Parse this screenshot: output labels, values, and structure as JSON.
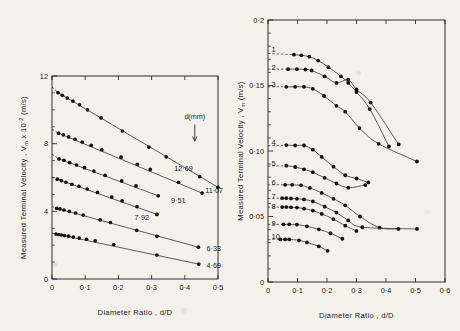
{
  "figure": {
    "background_color": "#f4f1ea",
    "ink_color": "#1b1b1b"
  },
  "chart_data": [
    {
      "id": "left-plot",
      "type": "scatter",
      "title": "",
      "xlabel": "Diameter Ratio , d/D",
      "ylabel": "Measured  Terminal  Velocity ,  Vₘ  x 10⁻² (m/s)",
      "ylabel_parts": {
        "prefix": "Measured  Terminal  Velocity ,  V",
        "sub": "m",
        "suffix": "  x 10",
        "exp": "-2",
        "units": " (m/s)"
      },
      "xlim": [
        0,
        0.5
      ],
      "ylim": [
        0,
        12
      ],
      "xticks": [
        0,
        0.1,
        0.2,
        0.3,
        0.4,
        0.5
      ],
      "xticklabels": [
        "0",
        "0·1",
        "0·2",
        "0·3",
        "0·4",
        "0·5"
      ],
      "yticks": [
        0,
        4,
        8,
        12
      ],
      "yticklabels": [
        "0",
        "4",
        "8",
        "12"
      ],
      "yminor_step": 1,
      "grid": false,
      "legend_position": "inline-right-of-each-series",
      "annotation": {
        "text": "d(mm)",
        "arrow": "down",
        "x": 0.43,
        "y": 9.2
      },
      "series": [
        {
          "name": "12·69",
          "label": "12·69",
          "label_x": 0.355,
          "label_y": 6.55,
          "intercept": 11.35,
          "points": [
            {
              "x": 0.018,
              "y": 11.02
            },
            {
              "x": 0.031,
              "y": 10.86
            },
            {
              "x": 0.046,
              "y": 10.7
            },
            {
              "x": 0.063,
              "y": 10.52
            },
            {
              "x": 0.083,
              "y": 10.3
            },
            {
              "x": 0.107,
              "y": 10.0
            },
            {
              "x": 0.148,
              "y": 9.52
            },
            {
              "x": 0.212,
              "y": 8.75
            },
            {
              "x": 0.292,
              "y": 7.8
            },
            {
              "x": 0.344,
              "y": 7.22
            },
            {
              "x": 0.445,
              "y": 6.05
            },
            {
              "x": 0.5,
              "y": 5.42
            }
          ]
        },
        {
          "name": "11·07",
          "label": "11·07",
          "label_x": 0.448,
          "label_y": 5.22,
          "intercept": 8.85,
          "points": [
            {
              "x": 0.02,
              "y": 8.62
            },
            {
              "x": 0.034,
              "y": 8.52
            },
            {
              "x": 0.05,
              "y": 8.4
            },
            {
              "x": 0.069,
              "y": 8.26
            },
            {
              "x": 0.091,
              "y": 8.1
            },
            {
              "x": 0.118,
              "y": 7.9
            },
            {
              "x": 0.15,
              "y": 7.64
            },
            {
              "x": 0.208,
              "y": 7.2
            },
            {
              "x": 0.257,
              "y": 6.78
            },
            {
              "x": 0.296,
              "y": 6.48
            },
            {
              "x": 0.381,
              "y": 5.72
            },
            {
              "x": 0.452,
              "y": 5.08
            }
          ]
        },
        {
          "name": "9·51",
          "label": "9·51",
          "label_x": 0.345,
          "label_y": 4.62,
          "intercept": 7.38,
          "points": [
            {
              "x": 0.021,
              "y": 7.1
            },
            {
              "x": 0.036,
              "y": 7.02
            },
            {
              "x": 0.053,
              "y": 6.88
            },
            {
              "x": 0.074,
              "y": 6.74
            },
            {
              "x": 0.098,
              "y": 6.58
            },
            {
              "x": 0.126,
              "y": 6.38
            },
            {
              "x": 0.16,
              "y": 6.12
            },
            {
              "x": 0.21,
              "y": 5.8
            },
            {
              "x": 0.253,
              "y": 5.5
            },
            {
              "x": 0.32,
              "y": 4.92
            }
          ]
        },
        {
          "name": "7·92",
          "label": "7·92",
          "label_x": 0.235,
          "label_y": 3.62,
          "intercept": 6.0,
          "points": [
            {
              "x": 0.016,
              "y": 5.9
            },
            {
              "x": 0.028,
              "y": 5.82
            },
            {
              "x": 0.042,
              "y": 5.72
            },
            {
              "x": 0.06,
              "y": 5.6
            },
            {
              "x": 0.081,
              "y": 5.48
            },
            {
              "x": 0.106,
              "y": 5.32
            },
            {
              "x": 0.137,
              "y": 5.12
            },
            {
              "x": 0.18,
              "y": 4.84
            },
            {
              "x": 0.211,
              "y": 4.62
            },
            {
              "x": 0.256,
              "y": 4.28
            },
            {
              "x": 0.316,
              "y": 3.82
            }
          ]
        },
        {
          "name": "6·33",
          "label": "6·33",
          "label_x": 0.452,
          "label_y": 1.78,
          "intercept": 4.28,
          "points": [
            {
              "x": 0.014,
              "y": 4.18
            },
            {
              "x": 0.024,
              "y": 4.14
            },
            {
              "x": 0.036,
              "y": 4.08
            },
            {
              "x": 0.052,
              "y": 4.0
            },
            {
              "x": 0.071,
              "y": 3.9
            },
            {
              "x": 0.094,
              "y": 3.78
            },
            {
              "x": 0.145,
              "y": 3.5
            },
            {
              "x": 0.176,
              "y": 3.34
            },
            {
              "x": 0.255,
              "y": 2.88
            },
            {
              "x": 0.316,
              "y": 2.52
            },
            {
              "x": 0.441,
              "y": 1.88
            }
          ]
        },
        {
          "name": "4·69",
          "label": "4·69",
          "label_x": 0.452,
          "label_y": 0.8,
          "intercept": 2.72,
          "points": [
            {
              "x": 0.012,
              "y": 2.66
            },
            {
              "x": 0.02,
              "y": 2.63
            },
            {
              "x": 0.028,
              "y": 2.6
            },
            {
              "x": 0.038,
              "y": 2.57
            },
            {
              "x": 0.05,
              "y": 2.53
            },
            {
              "x": 0.064,
              "y": 2.48
            },
            {
              "x": 0.082,
              "y": 2.42
            },
            {
              "x": 0.104,
              "y": 2.35
            },
            {
              "x": 0.13,
              "y": 2.26
            },
            {
              "x": 0.186,
              "y": 2.04
            },
            {
              "x": 0.316,
              "y": 1.42
            },
            {
              "x": 0.442,
              "y": 0.88
            }
          ]
        }
      ]
    },
    {
      "id": "right-plot",
      "type": "scatter",
      "title": "",
      "xlabel": "Diameter Ratio , d/D",
      "ylabel": "Measured  Terminal  Velocity ,  Vₘ   (m/s)",
      "ylabel_parts": {
        "prefix": "Measured  Terminal  Velocity ,  V",
        "sub": "m",
        "units": "   (m/s)"
      },
      "xlim": [
        0,
        0.6
      ],
      "ylim": [
        0,
        0.2
      ],
      "xticks": [
        0,
        0.1,
        0.2,
        0.3,
        0.4,
        0.5,
        0.6
      ],
      "xticklabels": [
        "0",
        "0·1",
        "0·2",
        "0·3",
        "0·4",
        "0·5",
        "0·6"
      ],
      "yticks": [
        0,
        0.05,
        0.1,
        0.15,
        0.2
      ],
      "yticklabels": [
        "0",
        "0·05",
        "0·10",
        "0·15",
        "0·2"
      ],
      "yminor_step": 0.01,
      "grid": false,
      "legend_position": "left-leader-lines",
      "series": [
        {
          "name": "1",
          "label": "1",
          "label_y": 0.1775,
          "plateau": 0.1745,
          "points": [
            {
              "x": 0.088,
              "y": 0.1735
            },
            {
              "x": 0.113,
              "y": 0.173
            },
            {
              "x": 0.14,
              "y": 0.172
            },
            {
              "x": 0.17,
              "y": 0.169
            },
            {
              "x": 0.205,
              "y": 0.164
            },
            {
              "x": 0.247,
              "y": 0.157
            },
            {
              "x": 0.272,
              "y": 0.152
            },
            {
              "x": 0.3,
              "y": 0.145
            },
            {
              "x": 0.345,
              "y": 0.132
            },
            {
              "x": 0.41,
              "y": 0.1035
            }
          ]
        },
        {
          "name": "2",
          "label": "2",
          "label_y": 0.164,
          "plateau": 0.1625,
          "points": [
            {
              "x": 0.068,
              "y": 0.1625
            },
            {
              "x": 0.098,
              "y": 0.1625
            },
            {
              "x": 0.127,
              "y": 0.1622
            },
            {
              "x": 0.148,
              "y": 0.1615
            },
            {
              "x": 0.192,
              "y": 0.157
            },
            {
              "x": 0.232,
              "y": 0.152
            },
            {
              "x": 0.272,
              "y": 0.1545
            },
            {
              "x": 0.3,
              "y": 0.147
            },
            {
              "x": 0.348,
              "y": 0.137
            },
            {
              "x": 0.443,
              "y": 0.105
            }
          ]
        },
        {
          "name": "3",
          "label": "3",
          "label_y": 0.1505,
          "plateau": 0.149,
          "points": [
            {
              "x": 0.062,
              "y": 0.149
            },
            {
              "x": 0.092,
              "y": 0.149
            },
            {
              "x": 0.122,
              "y": 0.149
            },
            {
              "x": 0.152,
              "y": 0.1475
            },
            {
              "x": 0.19,
              "y": 0.142
            },
            {
              "x": 0.232,
              "y": 0.1345
            },
            {
              "x": 0.262,
              "y": 0.13
            },
            {
              "x": 0.31,
              "y": 0.1175
            },
            {
              "x": 0.375,
              "y": 0.1055
            },
            {
              "x": 0.505,
              "y": 0.092
            }
          ]
        },
        {
          "name": "4",
          "label": "4",
          "label_y": 0.1065,
          "plateau": 0.104,
          "points": [
            {
              "x": 0.062,
              "y": 0.1045
            },
            {
              "x": 0.092,
              "y": 0.1042
            },
            {
              "x": 0.122,
              "y": 0.1042
            },
            {
              "x": 0.152,
              "y": 0.101
            },
            {
              "x": 0.182,
              "y": 0.0955
            },
            {
              "x": 0.222,
              "y": 0.088
            },
            {
              "x": 0.262,
              "y": 0.0815
            },
            {
              "x": 0.3,
              "y": 0.079
            },
            {
              "x": 0.34,
              "y": 0.076
            }
          ]
        },
        {
          "name": "5",
          "label": "5",
          "label_y": 0.0905,
          "plateau": 0.0885,
          "points": [
            {
              "x": 0.062,
              "y": 0.0888
            },
            {
              "x": 0.092,
              "y": 0.0878
            },
            {
              "x": 0.122,
              "y": 0.086
            },
            {
              "x": 0.152,
              "y": 0.0838
            },
            {
              "x": 0.192,
              "y": 0.0795
            },
            {
              "x": 0.232,
              "y": 0.0752
            },
            {
              "x": 0.272,
              "y": 0.072
            },
            {
              "x": 0.33,
              "y": 0.074
            }
          ]
        },
        {
          "name": "6",
          "label": "6",
          "label_y": 0.076,
          "plateau": 0.0742,
          "points": [
            {
              "x": 0.058,
              "y": 0.0742
            },
            {
              "x": 0.082,
              "y": 0.0742
            },
            {
              "x": 0.112,
              "y": 0.0738
            },
            {
              "x": 0.142,
              "y": 0.0718
            },
            {
              "x": 0.182,
              "y": 0.068
            },
            {
              "x": 0.222,
              "y": 0.0635
            },
            {
              "x": 0.262,
              "y": 0.0585
            },
            {
              "x": 0.312,
              "y": 0.05
            },
            {
              "x": 0.378,
              "y": 0.0415
            },
            {
              "x": 0.442,
              "y": 0.0405
            }
          ]
        },
        {
          "name": "7",
          "label": "7",
          "label_y": 0.0655,
          "plateau": 0.0638,
          "points": [
            {
              "x": 0.048,
              "y": 0.064
            },
            {
              "x": 0.062,
              "y": 0.064
            },
            {
              "x": 0.078,
              "y": 0.0638
            },
            {
              "x": 0.098,
              "y": 0.0635
            },
            {
              "x": 0.122,
              "y": 0.063
            },
            {
              "x": 0.152,
              "y": 0.0615
            },
            {
              "x": 0.192,
              "y": 0.0575
            },
            {
              "x": 0.232,
              "y": 0.053
            },
            {
              "x": 0.272,
              "y": 0.047
            },
            {
              "x": 0.32,
              "y": 0.0418
            },
            {
              "x": 0.505,
              "y": 0.0405
            }
          ]
        },
        {
          "name": "8",
          "label": "8",
          "label_y": 0.058,
          "plateau": 0.0572,
          "points": [
            {
              "x": 0.048,
              "y": 0.0572
            },
            {
              "x": 0.062,
              "y": 0.0572
            },
            {
              "x": 0.078,
              "y": 0.057
            },
            {
              "x": 0.098,
              "y": 0.0568
            },
            {
              "x": 0.122,
              "y": 0.056
            },
            {
              "x": 0.152,
              "y": 0.0545
            },
            {
              "x": 0.182,
              "y": 0.052
            },
            {
              "x": 0.222,
              "y": 0.048
            },
            {
              "x": 0.262,
              "y": 0.043
            },
            {
              "x": 0.3,
              "y": 0.039
            }
          ]
        },
        {
          "name": "9",
          "label": "9",
          "label_y": 0.045,
          "plateau": 0.044,
          "points": [
            {
              "x": 0.052,
              "y": 0.044
            },
            {
              "x": 0.072,
              "y": 0.044
            },
            {
              "x": 0.098,
              "y": 0.0438
            },
            {
              "x": 0.132,
              "y": 0.0425
            },
            {
              "x": 0.172,
              "y": 0.0402
            },
            {
              "x": 0.212,
              "y": 0.0372
            },
            {
              "x": 0.252,
              "y": 0.033
            }
          ]
        },
        {
          "name": "10",
          "label": "10",
          "label_y": 0.0345,
          "plateau": 0.0325,
          "points": [
            {
              "x": 0.042,
              "y": 0.0325
            },
            {
              "x": 0.058,
              "y": 0.0325
            },
            {
              "x": 0.072,
              "y": 0.0325
            },
            {
              "x": 0.105,
              "y": 0.0318
            },
            {
              "x": 0.132,
              "y": 0.0302
            },
            {
              "x": 0.172,
              "y": 0.0272
            },
            {
              "x": 0.202,
              "y": 0.0238
            }
          ]
        }
      ]
    }
  ]
}
